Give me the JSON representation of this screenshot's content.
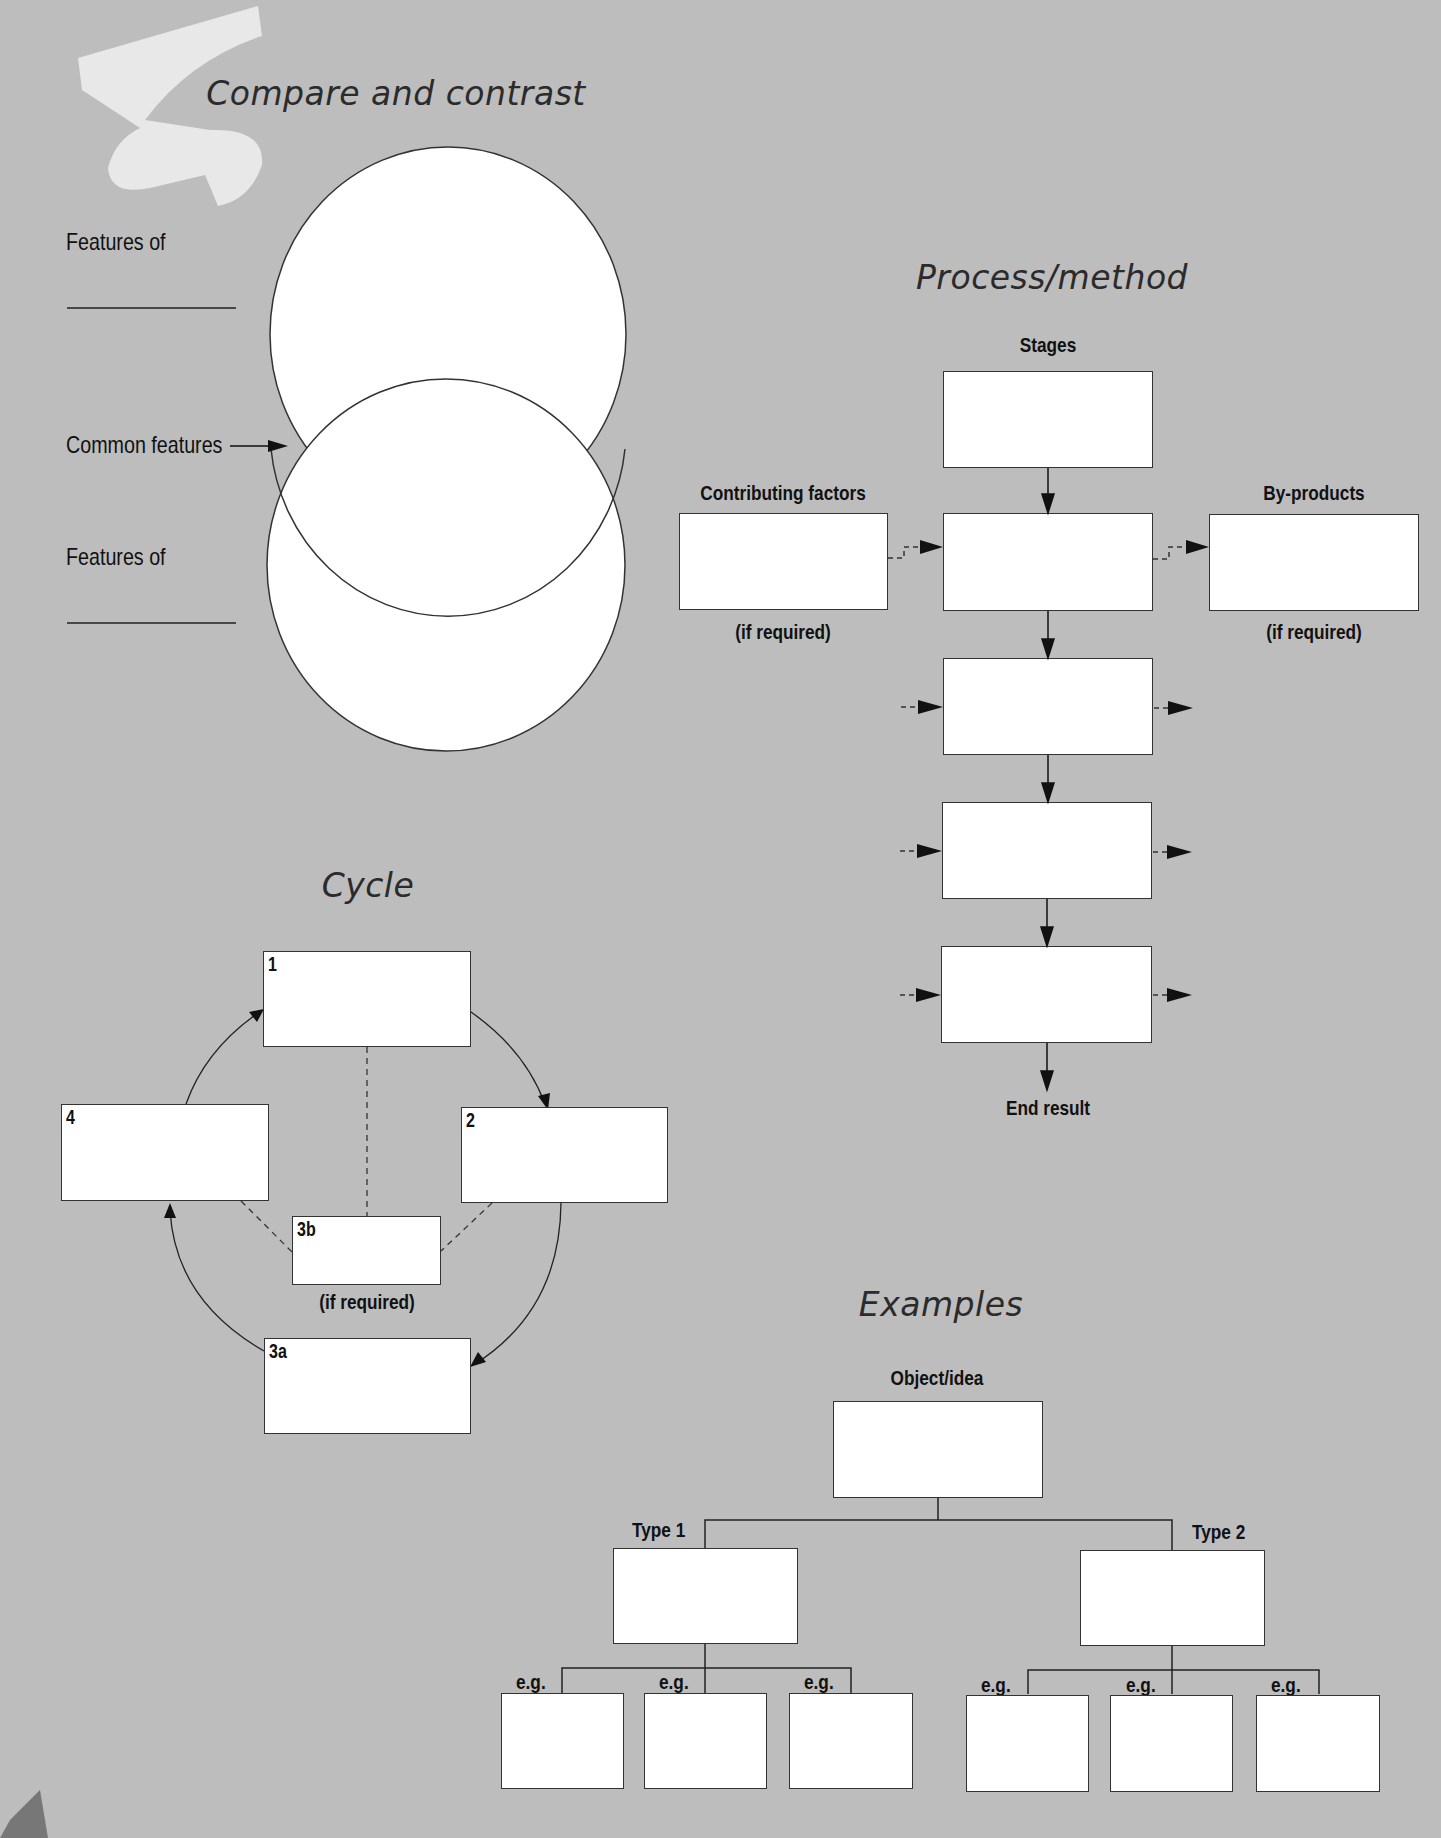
{
  "colors": {
    "background": "#bdbdbd",
    "box_fill": "#ffffff",
    "stroke": "#333333",
    "brush": "#ececec"
  },
  "compare": {
    "title": "Compare and contrast",
    "features_of_1": "Features of",
    "common_features": "Common features",
    "features_of_2": "Features of"
  },
  "process": {
    "title": "Process/method",
    "stages_label": "Stages",
    "contributing_label": "Contributing factors",
    "contributing_note": "(if required)",
    "byproducts_label": "By-products",
    "byproducts_note": "(if required)",
    "end_result": "End result"
  },
  "cycle": {
    "title": "Cycle",
    "boxes": [
      {
        "id": "1",
        "label": "1"
      },
      {
        "id": "2",
        "label": "2"
      },
      {
        "id": "3a",
        "label": "3a"
      },
      {
        "id": "3b",
        "label": "3b"
      },
      {
        "id": "4",
        "label": "4"
      }
    ],
    "note_3b": "(if required)"
  },
  "examples": {
    "title": "Examples",
    "root_label": "Object/idea",
    "type1_label": "Type 1",
    "type2_label": "Type 2",
    "eg_label": "e.g."
  }
}
